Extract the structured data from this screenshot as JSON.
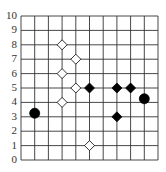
{
  "chart_data": {
    "type": "scatter",
    "title": "",
    "xlabel": "",
    "ylabel": "",
    "grid": true,
    "xlim": [
      0,
      10
    ],
    "ylim": [
      0,
      10
    ],
    "y_ticks": [
      "0",
      "1",
      "2",
      "3",
      "4",
      "5",
      "6",
      "7",
      "8",
      "9",
      "10"
    ],
    "x_ticks": [],
    "series": [
      {
        "name": "open-diamonds",
        "marker": "diamond",
        "fill": "#ffffff",
        "stroke": "#000000",
        "points": [
          [
            3,
            8
          ],
          [
            3,
            6
          ],
          [
            3,
            4
          ],
          [
            4,
            7
          ],
          [
            4,
            5
          ],
          [
            5,
            1
          ]
        ]
      },
      {
        "name": "filled-diamonds",
        "marker": "diamond",
        "fill": "#000000",
        "stroke": "#000000",
        "points": [
          [
            5,
            5
          ],
          [
            7,
            5
          ],
          [
            7,
            3
          ],
          [
            8,
            5
          ]
        ]
      },
      {
        "name": "filled-circles",
        "marker": "circle",
        "fill": "#000000",
        "stroke": "#000000",
        "points": [
          [
            1,
            3.25
          ],
          [
            9,
            4.25
          ]
        ]
      }
    ]
  },
  "grid": {
    "left": 21,
    "right": 158,
    "top": 16,
    "bottom": 160,
    "cols": 10,
    "rows": 10,
    "line_color": "#333333"
  }
}
